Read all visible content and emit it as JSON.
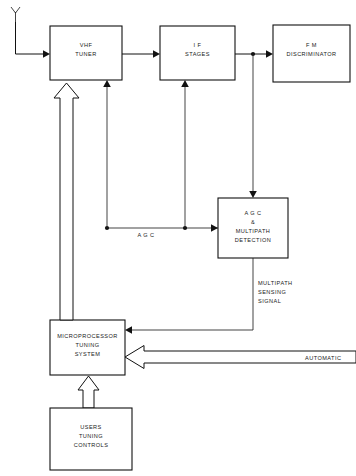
{
  "diagram": {
    "blocks": [
      {
        "id": "vhf_tuner",
        "lines": [
          "VHF",
          "TUNER"
        ]
      },
      {
        "id": "if_stages",
        "lines": [
          "I F",
          "STAGES"
        ]
      },
      {
        "id": "fm_discriminator",
        "lines": [
          "F M",
          "DISCRIMINATOR"
        ]
      },
      {
        "id": "agc_multipath",
        "lines": [
          "A G C",
          "&",
          "MULTIPATH",
          "DETECTION"
        ]
      },
      {
        "id": "microprocessor",
        "lines": [
          "MICROPROCESSOR",
          "TUNING",
          "SYSTEM"
        ]
      },
      {
        "id": "users_controls",
        "lines": [
          "USERS",
          "TUNING",
          "CONTROLS"
        ]
      }
    ],
    "labels": {
      "agc": "A G C",
      "multipath_1": "MULTIPATH",
      "multipath_2": "SENSING",
      "multipath_3": "SIGNAL",
      "automatic": "AUTOMATIC"
    },
    "icons": {
      "antenna": "antenna-icon"
    },
    "colors": {
      "line": "#111111",
      "background": "#ffffff",
      "text": "#1a1a1a"
    }
  }
}
